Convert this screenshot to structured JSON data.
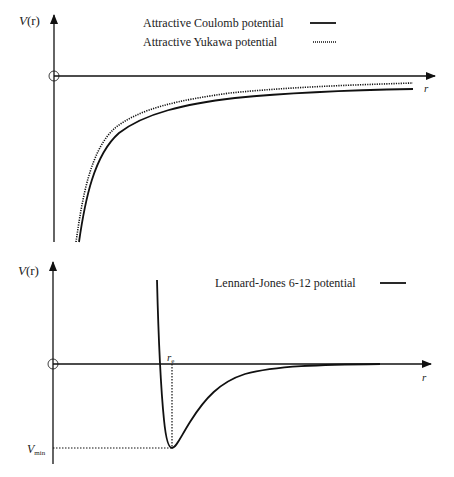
{
  "panels": [
    {
      "name": "coulomb-yukawa",
      "y_axis_label": "V(r)",
      "y_axis_label_parts": {
        "main": "V",
        "arg": "(r)"
      },
      "x_axis_label": "r",
      "legend": [
        {
          "label": "Attractive Coulomb potential",
          "style": "solid"
        },
        {
          "label": "Attractive Yukawa potential",
          "style": "dotted"
        }
      ]
    },
    {
      "name": "lennard-jones",
      "y_axis_label": "V(r)",
      "y_axis_label_parts": {
        "main": "V",
        "arg": "(r)"
      },
      "x_axis_label": "r",
      "annotations": {
        "r_e": {
          "main": "r",
          "sub": "e"
        },
        "v_min": {
          "main": "V",
          "sub": "min"
        }
      },
      "legend": [
        {
          "label": "Lennard-Jones 6-12 potential",
          "style": "solid"
        }
      ]
    }
  ],
  "colors": {
    "line": "#111111",
    "axis": "#111111",
    "text": "#222222",
    "background": "#ffffff"
  }
}
